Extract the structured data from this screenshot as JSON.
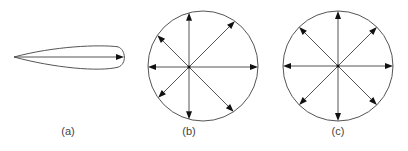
{
  "figure": {
    "line_color": "#555555",
    "arrow_color": "#111111",
    "panels": [
      {
        "id": "a",
        "label": "(a)",
        "label_pos": [
          68,
          132
        ],
        "shape": "teardrop",
        "tail": [
          14,
          57
        ],
        "head": [
          124,
          57
        ],
        "half_width": 12
      },
      {
        "id": "b",
        "label": "(b)",
        "label_pos": [
          189,
          132
        ],
        "shape": "circle",
        "circle_center": [
          203,
          66
        ],
        "radius": 55,
        "source": [
          189,
          67
        ],
        "directions_deg": [
          0,
          45,
          90,
          135,
          180,
          225,
          270,
          315
        ]
      },
      {
        "id": "c",
        "label": "(c)",
        "label_pos": [
          338,
          132
        ],
        "shape": "circle",
        "circle_center": [
          338,
          66
        ],
        "radius": 55,
        "source": [
          338,
          66
        ],
        "directions_deg": [
          0,
          45,
          90,
          135,
          180,
          225,
          270,
          315
        ]
      }
    ]
  }
}
